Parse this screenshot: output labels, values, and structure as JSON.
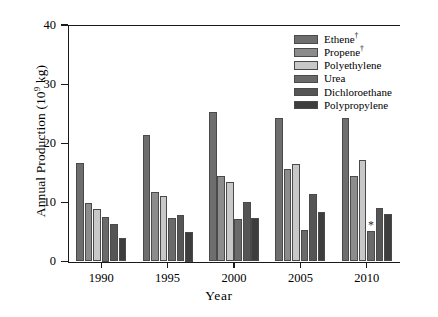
{
  "chart_data": {
    "type": "bar",
    "title": "",
    "xlabel": "Year",
    "ylabel": "Annual Production (10⁹ kg)",
    "ylabel_main": "Annual Production (10",
    "ylabel_exp": "9",
    "ylabel_tail": " kg)",
    "categories": [
      "1990",
      "1995",
      "2000",
      "2005",
      "2010"
    ],
    "ylim": [
      0,
      40
    ],
    "yticks": [
      0,
      10,
      20,
      30,
      40
    ],
    "ytick_labels": [
      "0",
      "10",
      "20",
      "30",
      "40"
    ],
    "grid": false,
    "legend_position": "top-right-inside",
    "series": [
      {
        "name": "Ethene",
        "label": "Ethene",
        "superscript": "†",
        "color": "#6e6e6e",
        "values": [
          16.6,
          21.4,
          25.3,
          24.2,
          24.2
        ]
      },
      {
        "name": "Propene",
        "label": "Propene",
        "superscript": "†",
        "color": "#8c8c8c",
        "values": [
          9.9,
          11.7,
          14.5,
          15.7,
          14.4
        ]
      },
      {
        "name": "Polyethylene",
        "label": "Polyethylene",
        "superscript": "",
        "color": "#c8c8c8",
        "values": [
          8.9,
          11.0,
          13.5,
          16.5,
          17.2
        ]
      },
      {
        "name": "Urea",
        "label": "Urea",
        "superscript": "",
        "color": "#6a6a6a",
        "values": [
          7.5,
          7.4,
          7.2,
          5.4,
          5.2
        ]
      },
      {
        "name": "Dichloroethane",
        "label": "Dichloroethane",
        "superscript": "",
        "color": "#555555",
        "values": [
          6.3,
          7.9,
          10.1,
          11.4,
          9.0
        ]
      },
      {
        "name": "Polypropylene",
        "label": "Polypropylene",
        "superscript": "",
        "color": "#3d3d3d",
        "values": [
          3.9,
          5.0,
          7.3,
          8.4,
          8.1
        ]
      }
    ],
    "annotations": [
      {
        "text": "*",
        "series": "Urea",
        "category": "2010",
        "value": 5.2
      }
    ]
  }
}
